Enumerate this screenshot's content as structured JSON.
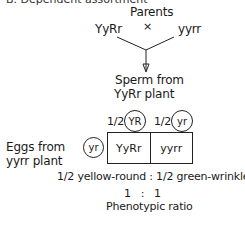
{
  "header_clipped": "B. Dependent assortment",
  "cross": {
    "title": "Parents",
    "symbol": "×",
    "parent_left": "YyRr",
    "parent_right": "yyrr"
  },
  "sperm": {
    "label_line1": "Sperm from",
    "label_line2": "YyRr plant",
    "gametes": [
      {
        "fraction": "1/2",
        "genotype": "YR"
      },
      {
        "fraction": "1/2",
        "genotype": "yr"
      }
    ]
  },
  "eggs": {
    "label_line1": "Eggs from",
    "label_line2": "yyrr plant",
    "gamete": "yr"
  },
  "punnett": {
    "cells": [
      "YyRr",
      "yyrr"
    ]
  },
  "result": {
    "phenotypes": "1/2 yellow-round : 1/2 green-wrinkled",
    "ratio": "1   :   1",
    "ratio_label": "Phenotypic ratio"
  }
}
